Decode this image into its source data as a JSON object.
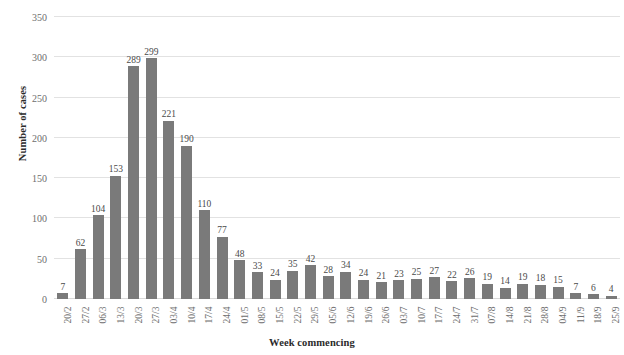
{
  "chart_data": {
    "type": "bar",
    "title": "",
    "xlabel": "Week commencing",
    "ylabel": "Number of cases",
    "ylim": [
      0,
      350
    ],
    "ytick_step": 50,
    "yticks": [
      0,
      50,
      100,
      150,
      200,
      250,
      300,
      350
    ],
    "grid": true,
    "legend": null,
    "bar_color": "#7a7a7a",
    "data_labels": true,
    "categories": [
      "20/2",
      "27/2",
      "06/3",
      "13/3",
      "20/3",
      "27/3",
      "03/4",
      "10/4",
      "17/4",
      "24/4",
      "01/5",
      "08/5",
      "15/5",
      "22/5",
      "29/5",
      "05/6",
      "12/6",
      "19/6",
      "26/6",
      "03/7",
      "10/7",
      "17/7",
      "24/7",
      "31/7",
      "07/8",
      "14/8",
      "21/8",
      "28/8",
      "04/9",
      "11/9",
      "18/9",
      "25/9"
    ],
    "values": [
      7,
      62,
      104,
      153,
      289,
      299,
      221,
      190,
      110,
      77,
      48,
      33,
      24,
      35,
      42,
      28,
      34,
      24,
      21,
      23,
      25,
      27,
      22,
      26,
      19,
      14,
      19,
      18,
      15,
      7,
      6,
      4
    ]
  }
}
